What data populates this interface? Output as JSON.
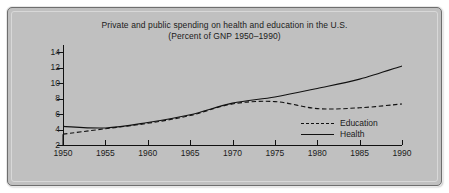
{
  "chart_data": {
    "type": "line",
    "title": "Private and public spending on health and education in the U.S.",
    "subtitle": "(Percent of GNP 1950–1990)",
    "xlabel": "",
    "ylabel": "",
    "xlim": [
      1950,
      1990
    ],
    "ylim": [
      2,
      14
    ],
    "xticks": [
      1950,
      1955,
      1960,
      1965,
      1970,
      1975,
      1980,
      1985,
      1990
    ],
    "yticks": [
      2,
      4,
      6,
      8,
      10,
      12,
      14
    ],
    "grid": false,
    "legend_position": "lower right",
    "x": [
      1950,
      1955,
      1960,
      1965,
      1970,
      1975,
      1980,
      1985,
      1990
    ],
    "series": [
      {
        "name": "Education",
        "style": "dashed",
        "color": "#111111",
        "values": [
          3.4,
          4.1,
          4.8,
          5.8,
          7.3,
          7.6,
          6.7,
          6.8,
          7.3
        ]
      },
      {
        "name": "Health",
        "style": "solid",
        "color": "#111111",
        "values": [
          4.4,
          4.2,
          4.9,
          5.9,
          7.4,
          8.2,
          9.3,
          10.5,
          12.2
        ]
      }
    ],
    "legend": [
      {
        "label": "Education",
        "style": "dashed"
      },
      {
        "label": "Health",
        "style": "solid"
      }
    ]
  },
  "figure": {
    "background_color": "#c0c0c0",
    "border_color": "#6e6e6e",
    "axis_color": "#111111"
  }
}
